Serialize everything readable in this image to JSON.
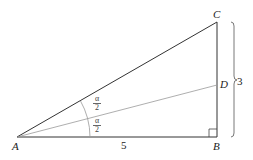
{
  "figure": {
    "points": {
      "A": "A",
      "B": "B",
      "C": "C",
      "D": "D"
    },
    "side_AB_label": "5",
    "side_BC_label": "3",
    "angle_upper_num": "α",
    "angle_upper_den": "2",
    "angle_lower_num": "α",
    "angle_lower_den": "2"
  },
  "colors": {
    "main_line": "#333333",
    "bisector": "#888888",
    "arc": "#999999"
  }
}
